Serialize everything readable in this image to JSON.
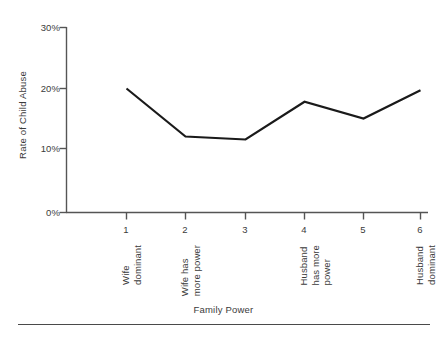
{
  "chart_data": {
    "type": "line",
    "title": "",
    "subtitle": "",
    "xlabel": "Family Power",
    "ylabel": "Rate of Child Abuse",
    "categories": [
      "1",
      "2",
      "3",
      "4",
      "5",
      "6"
    ],
    "category_descriptions": [
      "Wife\ndominant",
      "Wife has\nmore power",
      "",
      "Husband\nhas more\npower",
      "",
      "Husband\ndominant"
    ],
    "values": [
      20.0,
      12.0,
      11.5,
      17.8,
      15.0,
      19.7
    ],
    "value_unit": "%",
    "series": [
      {
        "name": "Rate of Child Abuse",
        "values": [
          20.0,
          12.0,
          11.5,
          17.8,
          15.0,
          19.7
        ]
      }
    ],
    "ylim": [
      0,
      30
    ],
    "ytick_values": [
      0,
      10,
      20,
      30
    ],
    "ytick_labels": [
      "0%",
      "10%",
      "20%",
      "30%"
    ],
    "xlim": [
      0.5,
      6.5
    ],
    "grid": false,
    "legend": false,
    "legend_position": "none",
    "line_color": "#1a1a1a",
    "axis_color": "#555555",
    "background_color": "#ffffff",
    "markers": false
  },
  "axes": {
    "y_title": "Rate of Child Abuse",
    "x_title": "Family Power",
    "y_ticks": [
      {
        "label": "30%",
        "value": 30
      },
      {
        "label": "20%",
        "value": 20
      },
      {
        "label": "10%",
        "value": 10
      },
      {
        "label": "0%",
        "value": 0
      }
    ],
    "x_ticks": [
      {
        "label": "1",
        "description_line1": "Wife",
        "description_line2": "dominant",
        "description_line3": ""
      },
      {
        "label": "2",
        "description_line1": "Wife has",
        "description_line2": "more power",
        "description_line3": ""
      },
      {
        "label": "3",
        "description_line1": "",
        "description_line2": "",
        "description_line3": ""
      },
      {
        "label": "4",
        "description_line1": "Husband",
        "description_line2": "has more",
        "description_line3": "power"
      },
      {
        "label": "5",
        "description_line1": "",
        "description_line2": "",
        "description_line3": ""
      },
      {
        "label": "6",
        "description_line1": "Husband",
        "description_line2": "dominant",
        "description_line3": ""
      }
    ]
  }
}
